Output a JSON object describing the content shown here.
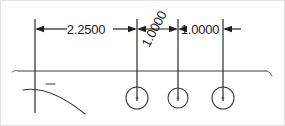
{
  "drawing": {
    "title": "Hole spacing dimension detail",
    "units": "inches",
    "line_color": "#2b2b2b",
    "text_color": "#1a1a1a",
    "background_color": "#ffffff",
    "border_color": "#e3e3e3"
  },
  "dimensions": [
    {
      "name": "dim-1",
      "label": "2.2500",
      "from_x": 34,
      "to_x": 136,
      "y": 28,
      "rotation": 0,
      "text_x": 85,
      "text_y": 33
    },
    {
      "name": "dim-2",
      "label": "1.0000",
      "from_x": 136,
      "to_x": 177,
      "y": 28,
      "rotation": -62,
      "text_x": 157,
      "text_y": 38
    },
    {
      "name": "dim-3",
      "label": "1.0000",
      "from_x": 177,
      "to_x": 222,
      "y": 28,
      "rotation": 0,
      "text_x": 199,
      "text_y": 33
    }
  ],
  "extension_lines": [
    {
      "name": "ext-line-datum",
      "x": 34,
      "y1": 18,
      "y2": 112
    },
    {
      "name": "ext-line-hole-1",
      "x": 136,
      "y1": 18,
      "y2": 100
    },
    {
      "name": "ext-line-hole-2",
      "x": 177,
      "y1": 18,
      "y2": 100
    },
    {
      "name": "ext-line-hole-3",
      "x": 222,
      "y1": 18,
      "y2": 100
    }
  ],
  "part_edge": {
    "name": "part-top-edge",
    "x1": 18,
    "x2": 266,
    "y": 70
  },
  "holes": [
    {
      "name": "hole-1",
      "cx": 136,
      "cy": 97,
      "r": 11
    },
    {
      "name": "hole-2",
      "cx": 177,
      "cy": 97,
      "r": 10
    },
    {
      "name": "hole-3",
      "cx": 222,
      "cy": 97,
      "r": 11
    }
  ],
  "fillet_arc": {
    "name": "fillet-arc",
    "path": "M 22 89 Q 48 84 84 113"
  },
  "small_dash": {
    "name": "reference-dash",
    "x1": 45,
    "x2": 54,
    "y": 83
  }
}
